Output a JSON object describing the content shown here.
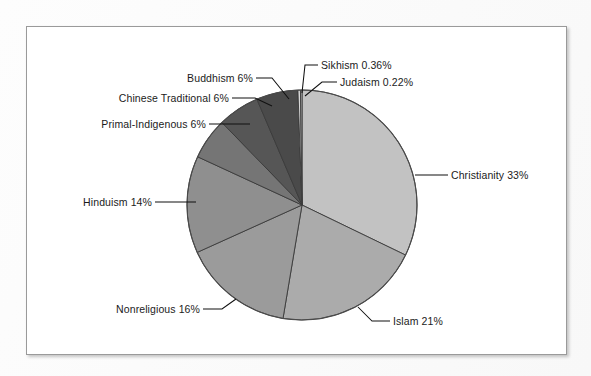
{
  "figure": {
    "background_color": "#fbfbfb",
    "frame_color": "#9a9a9a",
    "plot_background": "#ffffff"
  },
  "chart_data": {
    "type": "pie",
    "title": "",
    "subtitle": "",
    "xlabel": "",
    "ylabel": "",
    "legend_position": "none",
    "grid": false,
    "label_format": "{name} {value}%",
    "start_angle_deg": 0,
    "direction": "clockwise",
    "categories": [
      "Christianity",
      "Islam",
      "Nonreligious",
      "Hinduism",
      "Primal-Indigenous",
      "Chinese Traditional",
      "Buddhism",
      "Sikhism",
      "Judaism"
    ],
    "values": [
      33,
      21,
      16,
      14,
      6,
      6,
      6,
      0.36,
      0.22
    ],
    "value_labels": [
      "33%",
      "21%",
      "16%",
      "14%",
      "6%",
      "6%",
      "6%",
      "0.36%",
      "0.22%"
    ],
    "colors": [
      "#c2c2c2",
      "#ababab",
      "#9b9b9b",
      "#8f8f8f",
      "#757575",
      "#565656",
      "#4a4a4a",
      "#d8d8d8",
      "#bfbfbf"
    ],
    "slices": [
      {
        "name": "Christianity",
        "value": 33,
        "label": "Christianity 33%",
        "color": "#c2c2c2",
        "label_side": "right"
      },
      {
        "name": "Islam",
        "value": 21,
        "label": "Islam 21%",
        "color": "#ababab",
        "label_side": "right"
      },
      {
        "name": "Nonreligious",
        "value": 16,
        "label": "Nonreligious 16%",
        "color": "#9b9b9b",
        "label_side": "left"
      },
      {
        "name": "Hinduism",
        "value": 14,
        "label": "Hinduism 14%",
        "color": "#8f8f8f",
        "label_side": "left"
      },
      {
        "name": "Primal-Indigenous",
        "value": 6,
        "label": "Primal-Indigenous 6%",
        "color": "#757575",
        "label_side": "left"
      },
      {
        "name": "Chinese Traditional",
        "value": 6,
        "label": "Chinese Traditional 6%",
        "color": "#565656",
        "label_side": "left"
      },
      {
        "name": "Buddhism",
        "value": 6,
        "label": "Buddhism 6%",
        "color": "#4a4a4a",
        "label_side": "left"
      },
      {
        "name": "Sikhism",
        "value": 0.36,
        "label": "Sikhism 0.36%",
        "color": "#d8d8d8",
        "label_side": "right"
      },
      {
        "name": "Judaism",
        "value": 0.22,
        "label": "Judaism 0.22%",
        "color": "#bfbfbf",
        "label_side": "right"
      }
    ]
  },
  "labels": {
    "sikhism": "Sikhism 0.36%",
    "judaism": "Judaism 0.22%",
    "buddhism": "Buddhism 6%",
    "chinese_traditional": "Chinese Traditional 6%",
    "primal_indigenous": "Primal-Indigenous 6%",
    "hinduism": "Hinduism 14%",
    "nonreligious": "Nonreligious 16%",
    "islam": "Islam 21%",
    "christianity": "Christianity 33%"
  }
}
